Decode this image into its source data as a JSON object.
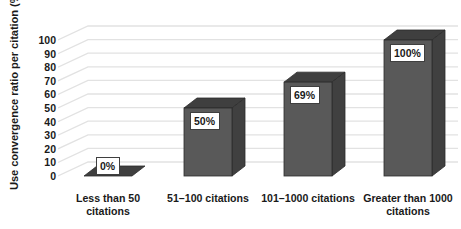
{
  "chart_data": {
    "type": "bar",
    "title": "",
    "subtitle": "",
    "xlabel": "",
    "ylabel": "Use convergence ratio per citation (%)",
    "ylim": [
      0,
      100
    ],
    "ytick_step": 10,
    "yticks": [
      "100",
      "90",
      "80",
      "70",
      "60",
      "50",
      "40",
      "30",
      "20",
      "10",
      "0"
    ],
    "ytick_values": [
      100,
      90,
      80,
      70,
      60,
      50,
      40,
      30,
      20,
      10,
      0
    ],
    "grid": true,
    "grid_axis": "y",
    "legend": false,
    "legend_position": "none",
    "three_d": true,
    "categories": [
      "Less than 50 citations",
      "51–100 citations",
      "101–1000 citations",
      "Greater than 1000 citations"
    ],
    "values": [
      0,
      50,
      69,
      100
    ],
    "data_labels": [
      "0%",
      "50%",
      "69%",
      "100%"
    ],
    "series": [
      {
        "name": "Use convergence ratio per citation",
        "values": [
          0,
          50,
          69,
          100
        ]
      }
    ]
  },
  "colors": {
    "bar_front": "#595959",
    "bar_top": "#3f3f3f",
    "bar_side": "#404040",
    "bar_outline": "#2b2b2b",
    "gridline": "#e2e2e2",
    "label_box_bg": "#ffffff",
    "label_box_border": "#3f3f3f",
    "text": "#1a1a1a",
    "background": "#ffffff"
  },
  "x_labels": [
    {
      "line1": "Less than 50",
      "line2": "citations"
    },
    {
      "line1": "51–100 citations",
      "line2": ""
    },
    {
      "line1": "101–1000 citations",
      "line2": ""
    },
    {
      "line1": "Greater than 1000",
      "line2": "citations"
    }
  ]
}
